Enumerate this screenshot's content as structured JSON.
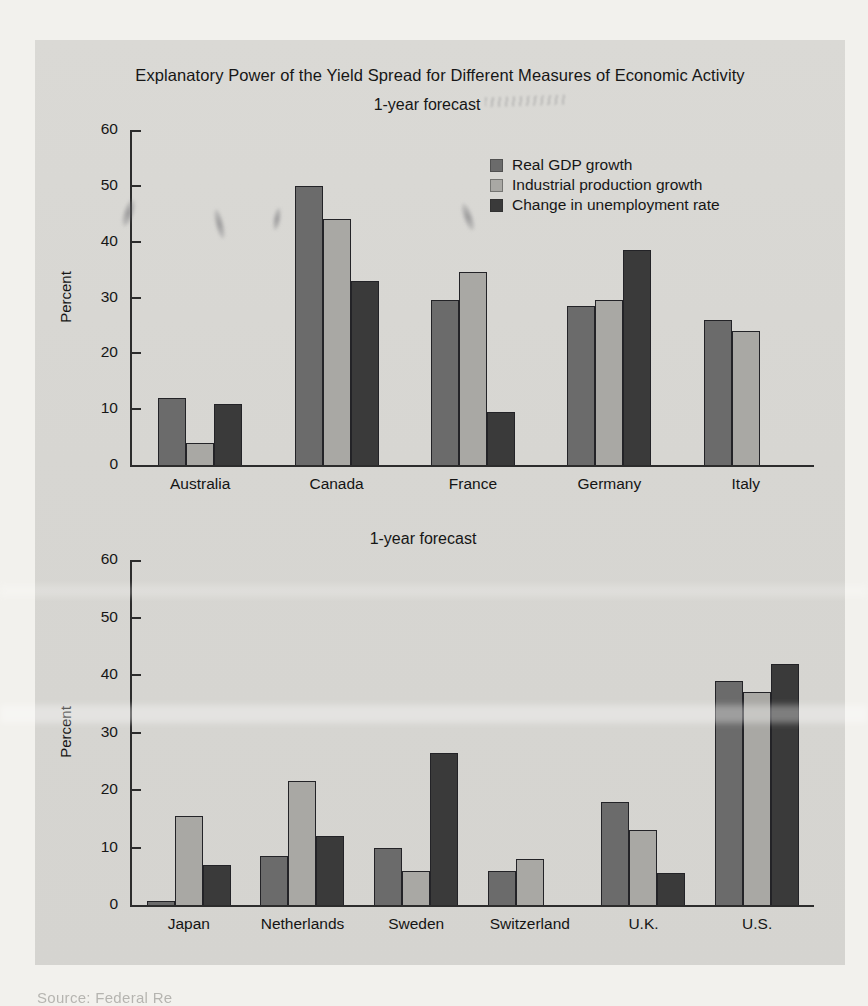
{
  "title": "Explanatory Power of the Yield Spread for Different Measures of Economic Activity",
  "source_note": "Source: Federal Re",
  "colors": {
    "page_background": "#f2f1ed",
    "panel_background": "#d7d6d2",
    "axis": "#2c2c2c",
    "real_gdp_bar": "#6b6b6b",
    "industrial_production_bar": "#a9a8a4",
    "unemployment_bar": "#3a3a3a"
  },
  "chart_data": [
    {
      "type": "bar",
      "subtitle": "1-year forecast",
      "ylabel": "Percent",
      "ylim": [
        0,
        60
      ],
      "yticks": [
        0,
        10,
        20,
        30,
        40,
        50,
        60
      ],
      "grid": false,
      "legend_position": "upper right inside plot",
      "categories": [
        "Australia",
        "Canada",
        "France",
        "Germany",
        "Italy"
      ],
      "series": [
        {
          "name": "Real GDP growth",
          "color": "#6b6b6b",
          "values": [
            12,
            50,
            29.5,
            28.5,
            26
          ]
        },
        {
          "name": "Industrial production growth",
          "color": "#a9a8a4",
          "values": [
            4,
            44,
            34.5,
            29.5,
            24
          ]
        },
        {
          "name": "Change in unemployment rate",
          "color": "#3a3a3a",
          "values": [
            11,
            33,
            9.5,
            38.5,
            null
          ]
        }
      ]
    },
    {
      "type": "bar",
      "subtitle": "1-year forecast",
      "ylabel": "Percent",
      "ylim": [
        0,
        60
      ],
      "yticks": [
        0,
        10,
        20,
        30,
        40,
        50,
        60
      ],
      "grid": false,
      "legend_position": "none",
      "categories": [
        "Japan",
        "Netherlands",
        "Sweden",
        "Switzerland",
        "U.K.",
        "U.S."
      ],
      "series": [
        {
          "name": "Real GDP growth",
          "color": "#6b6b6b",
          "values": [
            0.7,
            8.5,
            10,
            6,
            18,
            39
          ]
        },
        {
          "name": "Industrial production growth",
          "color": "#a9a8a4",
          "values": [
            15.5,
            21.5,
            6,
            8,
            13,
            37
          ]
        },
        {
          "name": "Change in unemployment rate",
          "color": "#3a3a3a",
          "values": [
            7,
            12,
            26.5,
            null,
            5.5,
            42
          ]
        }
      ]
    }
  ]
}
